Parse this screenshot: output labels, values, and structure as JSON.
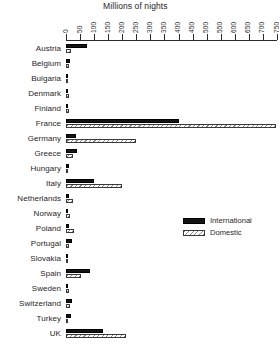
{
  "chart_data": {
    "type": "bar",
    "orientation": "horizontal",
    "title": "Millions of nights",
    "xlabel": "",
    "ylabel": "",
    "xlim": [
      0,
      750
    ],
    "grid": false,
    "legend_position": "middle-right",
    "xticks": [
      0,
      50,
      100,
      150,
      200,
      250,
      300,
      350,
      400,
      450,
      500,
      550,
      600,
      650,
      700,
      750
    ],
    "xticklabels": [
      "0",
      "50",
      "100",
      "150",
      "200",
      "250",
      "300",
      "350",
      "400",
      "450",
      "500",
      "550",
      "600",
      "650",
      "700",
      "750"
    ],
    "categories": [
      "Austria",
      "Belgium",
      "Bulgaria",
      "Denmark",
      "Finland",
      "France",
      "Germany",
      "Greece",
      "Hungary",
      "Italy",
      "Netherlands",
      "Norway",
      "Poland",
      "Portugal",
      "Slovakia",
      "Spain",
      "Sweden",
      "Switzerland",
      "Turkey",
      "UK"
    ],
    "series": [
      {
        "name": "International",
        "color": "#141414",
        "pattern": "solid",
        "values": [
          75,
          13,
          8,
          7,
          5,
          400,
          36,
          39,
          11,
          100,
          12,
          5,
          9,
          21,
          3,
          85,
          6,
          22,
          16,
          130
        ]
      },
      {
        "name": "Domestic",
        "color": "#ffffff",
        "pattern": "diagonal-hatch",
        "values": [
          19,
          9,
          6,
          12,
          11,
          745,
          250,
          26,
          6,
          200,
          24,
          14,
          28,
          10,
          4,
          55,
          11,
          14,
          8,
          215
        ]
      }
    ]
  },
  "legend": {
    "items": [
      {
        "label": "International",
        "swatch": "intl"
      },
      {
        "label": "Domestic",
        "swatch": "dom"
      }
    ]
  }
}
